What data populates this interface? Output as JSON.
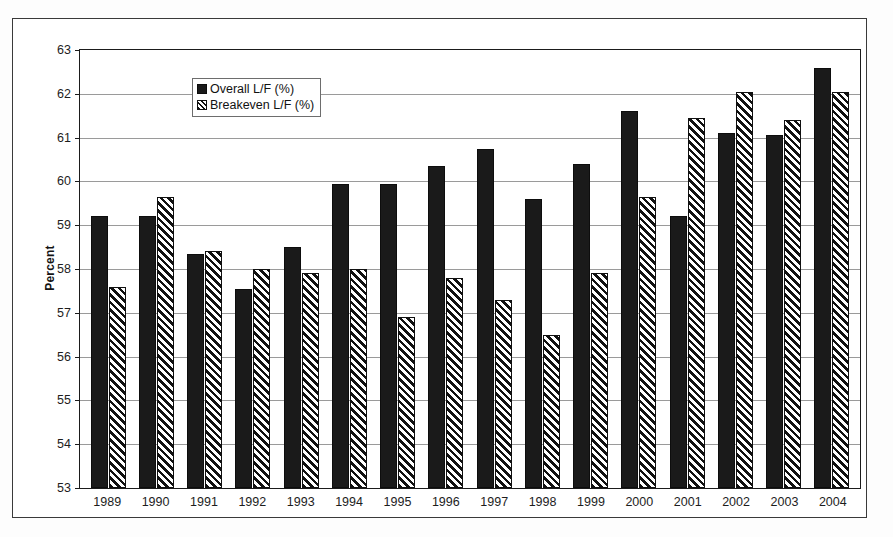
{
  "figure": {
    "frame_color": "#3a3a3a",
    "background": "#ffffff"
  },
  "legend": {
    "position": "top-left-inside",
    "entries": [
      {
        "label": "Overall L/F (%)",
        "icon": "solid-black-square-swatch",
        "color": "#1a1a1a"
      },
      {
        "label": "Breakeven L/F (%)",
        "icon": "diagonal-hatch-square-swatch",
        "color": "#111111"
      }
    ]
  },
  "chart_data": {
    "type": "bar",
    "title": "",
    "xlabel": "",
    "ylabel": "Percent",
    "ylim": [
      53,
      63
    ],
    "ytick_step": 1,
    "yticks": [
      "63",
      "62",
      "61",
      "60",
      "59",
      "58",
      "57",
      "56",
      "55",
      "54",
      "53"
    ],
    "grid": true,
    "categories": [
      "1989",
      "1990",
      "1991",
      "1992",
      "1993",
      "1994",
      "1995",
      "1996",
      "1997",
      "1998",
      "1999",
      "2000",
      "2001",
      "2002",
      "2003",
      "2004"
    ],
    "series": [
      {
        "name": "Overall L/F (%)",
        "values": [
          59.2,
          59.2,
          58.35,
          57.55,
          58.5,
          59.95,
          59.95,
          60.35,
          60.75,
          59.6,
          60.4,
          61.6,
          59.2,
          61.1,
          61.05,
          62.6
        ]
      },
      {
        "name": "Breakeven L/F (%)",
        "values": [
          57.6,
          59.65,
          58.4,
          58.0,
          57.9,
          58.0,
          56.9,
          57.8,
          57.3,
          56.5,
          57.9,
          59.65,
          61.45,
          62.05,
          61.4,
          62.05
        ]
      }
    ]
  }
}
